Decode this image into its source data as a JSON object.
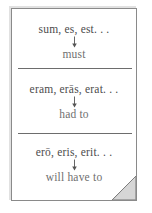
{
  "card": {
    "title": "Latin esse tense forms with English modal translations",
    "corner_icon": "page-fold-corner-icon",
    "paper_color": "#ffffff",
    "border_color": "#8a8a8a",
    "divider_color": "#6d6d6d",
    "latin_text_color": "#4c4c4c",
    "english_text_color": "#6f6f6f"
  },
  "sections": [
    {
      "id": "present",
      "latin": "sum, es, est. . .",
      "arrow": "down-arrow-icon",
      "english": "must"
    },
    {
      "id": "imperfect",
      "latin": "eram, erās, erat. . .",
      "arrow": "down-arrow-icon",
      "english": "had to"
    },
    {
      "id": "future",
      "latin": "erō, eris, erit. . .",
      "arrow": "down-arrow-icon",
      "english": "will have to"
    }
  ]
}
